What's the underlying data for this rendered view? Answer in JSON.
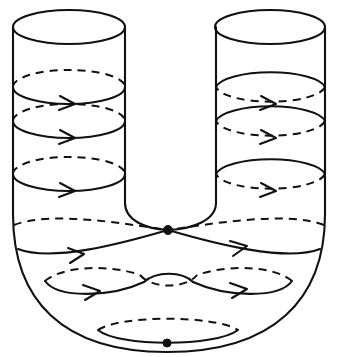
{
  "figure": {
    "type": "line-diagram",
    "background_color": "#ffffff",
    "stroke_color": "#111111",
    "canvas": {
      "width": 338,
      "height": 357
    }
  },
  "geometry": {
    "left_tube": {
      "center_x": 69,
      "outer_edge_x": 13,
      "inner_edge_x": 125,
      "radius_x": 56,
      "radius_y": 17,
      "top_ellipse_cy": 27,
      "wall_bottom_y": 230
    },
    "right_tube": {
      "center_x": 270,
      "outer_edge_x": 325,
      "inner_edge_x": 216,
      "radius_x": 55,
      "radius_y": 17,
      "top_ellipse_cy": 27,
      "wall_bottom_y": 230
    },
    "saddle_node": {
      "x": 168,
      "y": 230,
      "radius": 4.5,
      "label": "inner singular point"
    },
    "bottom_node": {
      "x": 167,
      "y": 343,
      "radius": 4.0,
      "label": "bottom singular point"
    },
    "bend_bottom_y": 352
  },
  "rings": {
    "left_tube_ring_cys": [
      87,
      121,
      174
    ],
    "right_tube_ring_cys": [
      87,
      121,
      174
    ],
    "ring_count_per_tube": 3,
    "saddle_ring_label": "separatrix ring through node",
    "lower_ring_label": "figure-eight ring",
    "bottom_ring_label": "bottom closed ring"
  },
  "arrows": {
    "direction": "rightward",
    "count": 11,
    "description": "flow orientation arrowheads on the front (solid) arcs"
  },
  "legend": {
    "solid_line": "front / visible arc",
    "dashed_line": "back / hidden arc",
    "dot": "singular point of the flow"
  }
}
